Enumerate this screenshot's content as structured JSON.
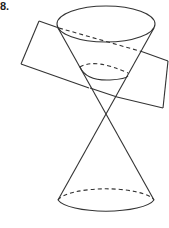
{
  "figure": {
    "label": "8.",
    "stroke_color": "#333333"
  }
}
